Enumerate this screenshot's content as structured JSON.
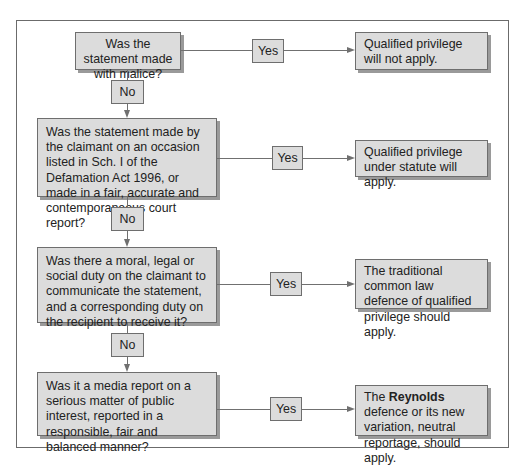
{
  "flowchart": {
    "questions": [
      {
        "text": "Was the statement made with malice?"
      },
      {
        "text": "Was the statement made by the claimant on an occasion listed in Sch. I of the Defamation Act 1996, or made in a fair, accurate and contemporaneous court report?"
      },
      {
        "text": "Was there a moral, legal or social duty on the claimant to communicate the statement, and a corresponding duty on the recipient to receive it?"
      },
      {
        "text": "Was it a media report on a serious matter of public interest, reported in a responsible, fair and balanced manner?"
      }
    ],
    "outcomes": [
      {
        "text": "Qualified privilege will not apply."
      },
      {
        "text": "Qualified privilege under statute will apply."
      },
      {
        "text": "The traditional common law defence of qualified privilege should apply."
      },
      {
        "prefix": "The ",
        "bold": "Reynolds",
        "suffix": " defence or its new variation, neutral reportage, should apply."
      }
    ],
    "yes_label": "Yes",
    "no_label": "No"
  }
}
